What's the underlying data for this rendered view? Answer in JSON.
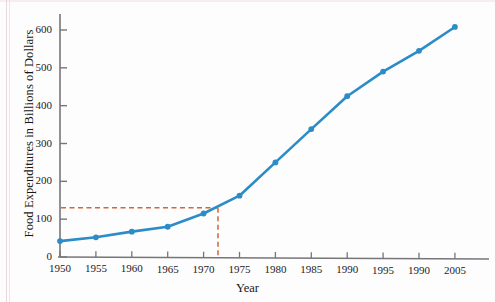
{
  "chart_data": {
    "type": "line",
    "title": "",
    "subtitle": "",
    "xlabel": "Year",
    "ylabel": "Food Expenditures in Billions of Dollars",
    "x": [
      1950,
      1955,
      1960,
      1965,
      1970,
      1975,
      1980,
      1985,
      1990,
      1995,
      2000,
      2005
    ],
    "values": [
      42,
      52,
      67,
      80,
      115,
      162,
      250,
      338,
      425,
      490,
      545,
      608
    ],
    "series": [
      {
        "name": "Food Expenditures",
        "values": [
          42,
          52,
          67,
          80,
          115,
          162,
          250,
          338,
          425,
          490,
          545,
          608
        ]
      }
    ],
    "x_tick_labels": [
      "1950",
      "1955",
      "1960",
      "1965",
      "1970",
      "1975",
      "1980",
      "1985",
      "1990",
      "1995",
      "1990",
      "2005"
    ],
    "y_tick_labels": [
      "0",
      "100",
      "200",
      "300",
      "400",
      "500",
      "600"
    ],
    "y_ticks": [
      0,
      100,
      200,
      300,
      400,
      500,
      600
    ],
    "xlim": [
      1950,
      2006
    ],
    "ylim": [
      0,
      640
    ],
    "grid": false,
    "legend": "none",
    "line_color": "#2b8cc7",
    "marker_color": "#2b8cc7",
    "axis_color": "#76767a",
    "annotation": {
      "name": "interpolation-guide",
      "color": "#d4643a",
      "style": "dashed",
      "x_value": 1972,
      "y_value": 130,
      "description": "dashed guide lines from y-axis to curve and down to x-axis"
    }
  },
  "axes": {
    "y_label_text": "Food Expenditures in Billions of Dollars",
    "x_label_text": "Year"
  }
}
